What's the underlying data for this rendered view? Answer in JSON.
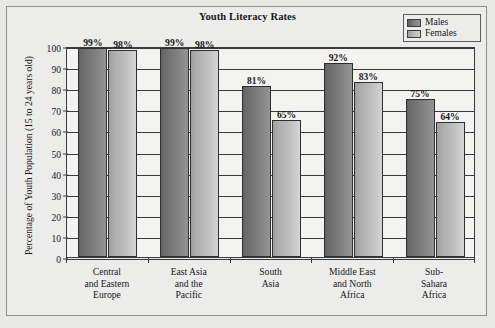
{
  "chart_data": {
    "type": "bar",
    "title": "Youth Literacy Rates",
    "xlabel": "",
    "ylabel": "Percentage of Youth Population (15 to 24 years old)",
    "ylim": [
      0,
      100
    ],
    "ytick_values": [
      100,
      90,
      80,
      70,
      60,
      50,
      40,
      30,
      20,
      10,
      0
    ],
    "ytick_labels": [
      "100",
      "90",
      "80",
      "70",
      "60",
      "50",
      "40",
      "30",
      "20",
      "10",
      "0"
    ],
    "grid": true,
    "legend_position": "top-right",
    "categories": [
      "Central\nand Eastern\nEurope",
      "East Asia\nand the\nPacific",
      "South\nAsia",
      "Middle East\nand North\nAfrica",
      "Sub-\nSahara\nAfrica"
    ],
    "category_lines": [
      [
        "Central",
        "and Eastern",
        "Europe"
      ],
      [
        "East Asia",
        "and the",
        "Pacific"
      ],
      [
        "South",
        "Asia"
      ],
      [
        "Middle East",
        "and North",
        "Africa"
      ],
      [
        "Sub-",
        "Sahara",
        "Africa"
      ]
    ],
    "series": [
      {
        "name": "Males",
        "color": "#7b7b7b",
        "values": [
          99,
          99,
          81,
          92,
          75
        ],
        "data_labels": [
          "99%",
          "99%",
          "81%",
          "92%",
          "75%"
        ]
      },
      {
        "name": "Females",
        "color": "#bdbdbd",
        "values": [
          98,
          98,
          65,
          83,
          64
        ],
        "data_labels": [
          "98%",
          "98%",
          "65%",
          "83%",
          "64%"
        ]
      }
    ]
  },
  "legend": {
    "items": [
      {
        "label": "Males",
        "swatch": "male-swatch"
      },
      {
        "label": "Females",
        "swatch": "female-swatch"
      }
    ]
  }
}
